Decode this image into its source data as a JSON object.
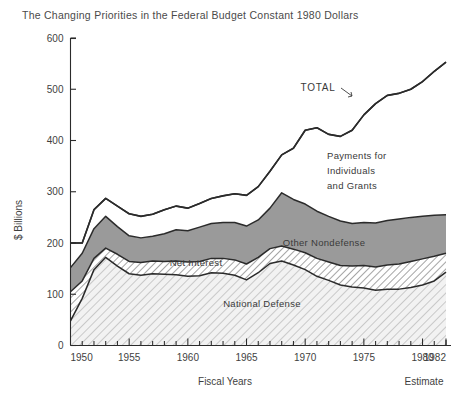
{
  "chart_data": {
    "type": "area",
    "title": "The Changing Priorities in the Federal Budget Constant 1980 Dollars",
    "xlabel": "Fiscal Years",
    "ylabel": "$ Billions",
    "xlim": [
      1950,
      1982
    ],
    "ylim": [
      0,
      600
    ],
    "grid": false,
    "legend": "inline-annotations",
    "y_ticks": [
      "0",
      "100",
      "200",
      "300",
      "400",
      "500",
      "600"
    ],
    "y_tick_values": [
      0,
      100,
      200,
      300,
      400,
      500,
      600
    ],
    "x_ticks": [
      "1950",
      "1955",
      "1960",
      "1965",
      "1970",
      "1975",
      "1980",
      "1982"
    ],
    "x_tick_values": [
      1950,
      1955,
      1960,
      1965,
      1970,
      1975,
      1980,
      1982
    ],
    "x_minor_interval": 1,
    "estimate_note": "Estimate",
    "stacking": "cumulative",
    "x": [
      1950,
      1951,
      1952,
      1953,
      1954,
      1955,
      1956,
      1957,
      1958,
      1959,
      1960,
      1961,
      1962,
      1963,
      1964,
      1965,
      1966,
      1967,
      1968,
      1969,
      1970,
      1971,
      1972,
      1973,
      1974,
      1975,
      1976,
      1977,
      1978,
      1979,
      1980,
      1981,
      1982
    ],
    "series": [
      {
        "name": "National Defense",
        "fill": "light-diagonal-hatch",
        "label_position": "inside-lower",
        "values": [
          48,
          92,
          148,
          172,
          155,
          140,
          137,
          140,
          139,
          138,
          135,
          136,
          142,
          141,
          137,
          128,
          142,
          160,
          165,
          157,
          148,
          135,
          127,
          118,
          114,
          112,
          108,
          110,
          110,
          113,
          118,
          126,
          143
        ]
      },
      {
        "name": "Net Interest",
        "fill": "dense-diagonal-hatch",
        "label_position": "inside-middle",
        "cumulative_top": [
          105,
          126,
          170,
          190,
          178,
          164,
          162,
          165,
          164,
          165,
          163,
          164,
          170,
          170,
          167,
          159,
          172,
          189,
          194,
          188,
          181,
          170,
          163,
          156,
          155,
          156,
          153,
          157,
          159,
          164,
          169,
          174,
          180
        ],
        "values": [
          57,
          34,
          22,
          18,
          23,
          24,
          25,
          25,
          25,
          27,
          28,
          28,
          28,
          29,
          30,
          31,
          30,
          29,
          29,
          31,
          33,
          35,
          36,
          38,
          41,
          44,
          45,
          47,
          49,
          51,
          51,
          48,
          37
        ]
      },
      {
        "name": "Other Nondefense",
        "fill": "solid-gray",
        "color": "#9a9a9a",
        "label_position": "inside-upper",
        "cumulative_top": [
          152,
          180,
          228,
          252,
          232,
          214,
          210,
          213,
          218,
          226,
          224,
          231,
          238,
          240,
          240,
          233,
          245,
          268,
          298,
          285,
          276,
          262,
          252,
          243,
          238,
          240,
          239,
          244,
          247,
          250,
          252,
          254,
          255
        ],
        "values": [
          47,
          54,
          58,
          62,
          54,
          50,
          48,
          48,
          54,
          61,
          61,
          67,
          68,
          70,
          73,
          74,
          73,
          79,
          104,
          97,
          95,
          92,
          89,
          87,
          83,
          84,
          86,
          87,
          88,
          86,
          83,
          80,
          75
        ]
      },
      {
        "name": "Payments for Individuals and Grants",
        "fill": "white",
        "label_position": "inside-top-right",
        "cumulative_top": [
          200,
          200,
          265,
          287,
          272,
          257,
          252,
          256,
          265,
          272,
          268,
          277,
          287,
          292,
          296,
          293,
          310,
          340,
          372,
          385,
          420,
          425,
          412,
          408,
          420,
          450,
          472,
          488,
          492,
          500,
          515,
          535,
          553
        ],
        "values": [
          48,
          20,
          37,
          35,
          40,
          43,
          42,
          43,
          47,
          46,
          44,
          46,
          49,
          52,
          56,
          60,
          65,
          72,
          74,
          100,
          144,
          163,
          160,
          165,
          182,
          210,
          233,
          244,
          245,
          250,
          263,
          281,
          298
        ]
      }
    ],
    "total_line": {
      "name": "TOTAL",
      "values": [
        200,
        200,
        265,
        287,
        272,
        257,
        252,
        256,
        265,
        272,
        268,
        277,
        287,
        292,
        296,
        293,
        310,
        340,
        372,
        385,
        420,
        425,
        412,
        408,
        420,
        450,
        472,
        488,
        492,
        500,
        515,
        535,
        553
      ],
      "annotation": "TOTAL",
      "annotation_has_leader": true
    },
    "annotations": [
      {
        "text": "TOTAL",
        "kind": "series-callout"
      },
      {
        "text": "Payments for",
        "kind": "series-label-line1"
      },
      {
        "text": "Individuals",
        "kind": "series-label-line2"
      },
      {
        "text": "and Grants",
        "kind": "series-label-line3"
      },
      {
        "text": "Other Nondefense",
        "kind": "series-label"
      },
      {
        "text": "Net Interest",
        "kind": "series-label"
      },
      {
        "text": "National Defense",
        "kind": "series-label"
      }
    ]
  },
  "labels": {
    "total": "TOTAL",
    "payments_line1": "Payments for",
    "payments_line2": "Individuals",
    "payments_line3": "and Grants",
    "other_nondefense": "Other Nondefense",
    "net_interest": "Net Interest",
    "national_defense": "National Defense",
    "fiscal_years": "Fiscal Years",
    "estimate": "Estimate",
    "dollars_billions": "$ Billions"
  },
  "y_tick_labels": [
    "600",
    "500",
    "400",
    "300",
    "200",
    "100",
    "0"
  ],
  "x_tick_labels": [
    "1950",
    "1955",
    "1960",
    "1965",
    "1970",
    "1975",
    "1980",
    "1982"
  ],
  "colors": {
    "ink": "#2b2b2b",
    "gray_band": "#9a9a9a",
    "hatch_ink": "#4a4a4a",
    "background": "#ffffff"
  }
}
